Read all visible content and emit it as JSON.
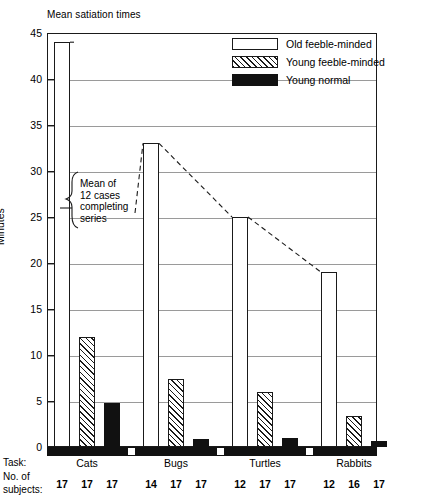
{
  "chart_data": {
    "type": "bar",
    "title": "Mean satiation times",
    "xlabel": "Task:",
    "ylabel": "Minutes",
    "ylim": [
      0,
      45
    ],
    "yticks": [
      0,
      5,
      10,
      15,
      20,
      25,
      30,
      35,
      40,
      45
    ],
    "grid": true,
    "legend_position": "top-right",
    "categories": [
      "Cats",
      "Bugs",
      "Turtles",
      "Rabbits"
    ],
    "series": [
      {
        "name": "Old feeble-minded",
        "values": [
          44,
          33,
          25,
          19
        ]
      },
      {
        "name": "Young feeble-minded",
        "values": [
          12,
          7.4,
          6,
          3.4
        ]
      },
      {
        "name": "Young normal",
        "values": [
          4.8,
          0.9,
          1.0,
          0.7
        ]
      }
    ],
    "subjects_row_label_line1": "No. of",
    "subjects_row_label_line2": "subjects:",
    "subjects": [
      [
        17,
        17,
        17
      ],
      [
        14,
        17,
        17
      ],
      [
        12,
        17,
        17
      ],
      [
        12,
        16,
        17
      ]
    ],
    "annotation": {
      "text": "Mean of\n12 cases\ncompleting\nseries",
      "connector": "dashed-line-linking-old-feeble-minded-bar-tops"
    },
    "colors": {
      "axis": "#1a1a1a",
      "grid": "#9a9a9a",
      "solid_fill": "#111111",
      "open_fill": "#ffffff"
    }
  }
}
